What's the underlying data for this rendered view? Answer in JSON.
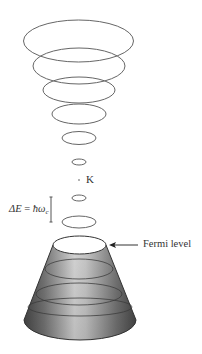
{
  "figure": {
    "type": "landau-level-tubes-diagram",
    "colors": {
      "stroke": "#666666",
      "cone_stroke": "#333333",
      "cone_gradient_dark": "#4a4a4a",
      "cone_gradient_light": "#e0e0e0",
      "background": "#ffffff",
      "text": "#333333"
    },
    "labels": {
      "k_point": "K",
      "fermi_level": "Fermi level",
      "delta_e_prefix": "ΔE",
      "delta_e_equals": " = ",
      "delta_e_hbar": "ħω",
      "delta_e_sub": "c"
    },
    "upper_ellipses": [
      {
        "cx": 78.5,
        "cy": 41,
        "rx": 55,
        "ry": 21
      },
      {
        "cx": 79,
        "cy": 66,
        "rx": 46,
        "ry": 18
      },
      {
        "cx": 79,
        "cy": 90,
        "rx": 36,
        "ry": 13
      },
      {
        "cx": 79,
        "cy": 114,
        "rx": 27,
        "ry": 10
      },
      {
        "cx": 79,
        "cy": 138,
        "rx": 17,
        "ry": 6.5
      },
      {
        "cx": 79,
        "cy": 162,
        "rx": 7,
        "ry": 3
      }
    ],
    "k_point": {
      "x": 79,
      "y": 180
    },
    "lower_ellipses": [
      {
        "cx": 79,
        "cy": 198,
        "rx": 7,
        "ry": 3
      },
      {
        "cx": 79,
        "cy": 222,
        "rx": 17,
        "ry": 6
      }
    ],
    "cone": {
      "top": {
        "cx": 79.5,
        "cy": 245,
        "rx": 26.5,
        "ry": 9
      },
      "rings": [
        {
          "cx": 79,
          "cy": 269,
          "rx": 34,
          "ry": 10
        },
        {
          "cx": 79,
          "cy": 294,
          "rx": 43,
          "ry": 11
        },
        {
          "cx": 80,
          "cy": 307,
          "rx": 52,
          "ry": 9
        }
      ],
      "bottom": {
        "cx": 80,
        "cy": 320,
        "rx": 56,
        "ry": 20
      }
    },
    "bracket": {
      "x": 51,
      "y1": 197,
      "y2": 222
    },
    "fermi_arrow": {
      "x1": 138,
      "x2": 109,
      "y": 245
    }
  }
}
